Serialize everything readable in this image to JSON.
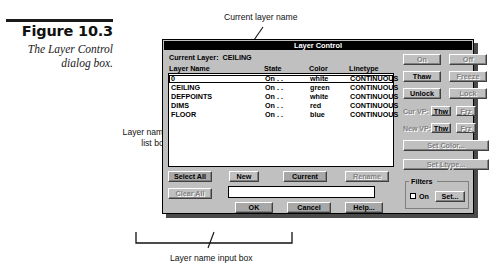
{
  "figure": {
    "number": "Figure 10.3",
    "caption": "The Layer\nControl dialog\nbox."
  },
  "annotations": {
    "current_layer_name": "Current layer name",
    "layer_name_list_box": "Layer name\nlist box",
    "layer_name_input_box": "Layer name input box"
  },
  "dialog": {
    "title": "Layer Control",
    "current_layer": "Current Layer:  CEILING",
    "columns": [
      "Layer Name",
      "State",
      "Color",
      "Linetype"
    ],
    "rows": [
      {
        "name": "0",
        "state": "On . .",
        "color": "white",
        "linetype": "CONTINUOUS",
        "selected": true
      },
      {
        "name": "CEILING",
        "state": "On . .",
        "color": "green",
        "linetype": "CONTINUOUS",
        "selected": false
      },
      {
        "name": "DEFPOINTS",
        "state": "On . .",
        "color": "white",
        "linetype": "CONTINUOUS",
        "selected": false
      },
      {
        "name": "DIMS",
        "state": "On . .",
        "color": "red",
        "linetype": "CONTINUOUS",
        "selected": false
      },
      {
        "name": "FLOOR",
        "state": "On . .",
        "color": "blue",
        "linetype": "CONTINUOUS",
        "selected": false
      }
    ],
    "state_buttons": {
      "on": "On",
      "off": "Off",
      "thaw": "Thaw",
      "freeze": "Freeze",
      "unlock": "Unlock",
      "lock": "Lock"
    },
    "viewport": {
      "cur_vp_label": "Cur VP:",
      "new_vp_label": "New VP:",
      "cur_thw": "Thw",
      "cur_frz": "Frz",
      "new_thw": "Thw",
      "new_frz": "Frz"
    },
    "set_color": "Set Color...",
    "set_ltype": "Set Ltype...",
    "bottom_buttons": {
      "select_all": "Select All",
      "clear_all": "Clear All",
      "new": "New",
      "current": "Current",
      "rename": "Rename"
    },
    "name_input_value": "",
    "filters": {
      "group_label": "Filters",
      "on_label": "On",
      "on_checked": false,
      "set": "Set..."
    },
    "action_buttons": {
      "ok": "OK",
      "cancel": "Cancel",
      "help": "Help..."
    }
  }
}
